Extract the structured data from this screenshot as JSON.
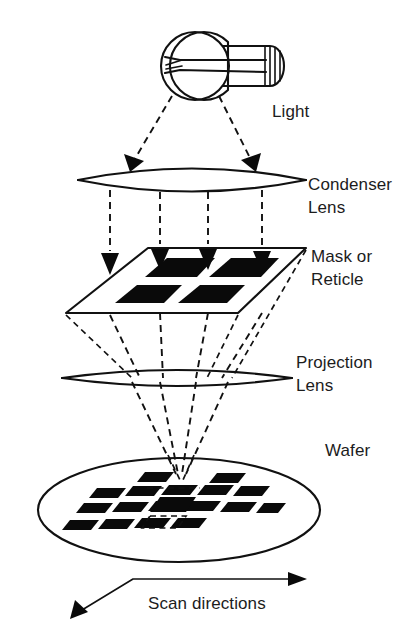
{
  "figure": {
    "background_color": "#ffffff",
    "ink_color": "#111111",
    "width": 418,
    "height": 643
  },
  "labels": {
    "light": "Light",
    "condenser_lens_line1": "Condenser",
    "condenser_lens_line2": "Lens",
    "mask_line1": "Mask or",
    "mask_line2": "Reticle",
    "projection_lens_line1": "Projection",
    "projection_lens_line2": "Lens",
    "wafer": "Wafer",
    "scan_directions": "Scan directions"
  },
  "components": [
    {
      "name": "light-source",
      "label": "Light",
      "type": "lamp",
      "shape": "incandescent bulb with filament, base to the right",
      "center": [
        195,
        65
      ]
    },
    {
      "name": "condenser-lens",
      "label": "Condenser Lens",
      "type": "lens",
      "shape": "biconvex lens in perspective",
      "center": [
        192,
        176
      ],
      "span_x": [
        78,
        306
      ]
    },
    {
      "name": "mask-reticle",
      "label": "Mask or Reticle",
      "type": "plane",
      "shape": "parallelogram plate with 4 opaque chrome patterns",
      "pattern_count": 4
    },
    {
      "name": "projection-lens",
      "label": "Projection Lens",
      "type": "lens",
      "shape": "biconvex lens in perspective",
      "center": [
        176,
        378
      ],
      "span_x": [
        62,
        292
      ]
    },
    {
      "name": "wafer",
      "label": "Wafer",
      "type": "disc",
      "shape": "ellipse disc with array of exposed die fields",
      "center": [
        179,
        510
      ],
      "radii": [
        141,
        52
      ]
    }
  ],
  "ray_paths": {
    "illumination": "two dashed rays from lamp diverging to condenser lens",
    "condenser_to_mask": "four vertical dashed rays from condenser lens down through mask",
    "mask_to_wafer": "four dashed rays converging through projection lens to a focus point on the wafer"
  },
  "scan_arrow": {
    "label": "Scan directions",
    "heads": 2,
    "directions": [
      "right",
      "down-left"
    ]
  }
}
